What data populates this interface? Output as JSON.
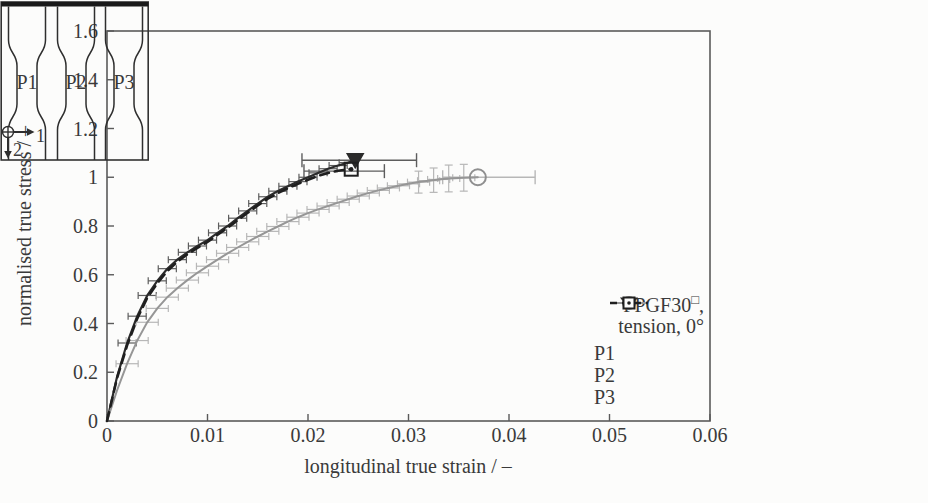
{
  "figure": {
    "background": "#fcfcfb",
    "axis_color": "#5a5a5a",
    "text_color": "#3a3a3a"
  },
  "chart_data": {
    "type": "line",
    "title": "",
    "xlabel": "longitudinal true strain / –",
    "ylabel": "normalised true stress / –",
    "xlim": [
      0,
      0.06
    ],
    "ylim": [
      0,
      1.6
    ],
    "grid": false,
    "legend_position": "inside-bottom-right",
    "x_ticks": {
      "values": [
        0,
        0.01,
        0.02,
        0.03,
        0.04,
        0.05,
        0.06
      ],
      "labels": [
        "0",
        "0.01",
        "0.02",
        "0.03",
        "0.04",
        "0.05",
        "0.06"
      ]
    },
    "y_ticks": {
      "values": [
        0,
        0.2,
        0.4,
        0.6,
        0.8,
        1.0,
        1.2,
        1.4,
        1.6
      ],
      "labels": [
        "0",
        "0.2",
        "0.4",
        "0.6",
        "0.8",
        "1",
        "1.2",
        "1.4",
        "1.6"
      ]
    },
    "series": [
      {
        "name": "P1",
        "color": "#2b2b2b",
        "line": "solid",
        "width": 2.2,
        "marker": "triangle-down",
        "marker_color": "#2b2b2b",
        "err_color": "#5d5d5d",
        "x_err": 0.0009,
        "end_bar": {
          "y": 1.07,
          "x0": 0.0194,
          "x1": 0.0308
        },
        "points": [
          [
            0,
            0
          ],
          [
            0.001,
            0.18
          ],
          [
            0.002,
            0.32
          ],
          [
            0.003,
            0.43
          ],
          [
            0.004,
            0.515
          ],
          [
            0.005,
            0.575
          ],
          [
            0.006,
            0.625
          ],
          [
            0.007,
            0.662
          ],
          [
            0.008,
            0.692
          ],
          [
            0.009,
            0.718
          ],
          [
            0.01,
            0.742
          ],
          [
            0.011,
            0.772
          ],
          [
            0.012,
            0.8
          ],
          [
            0.013,
            0.832
          ],
          [
            0.014,
            0.862
          ],
          [
            0.015,
            0.892
          ],
          [
            0.016,
            0.92
          ],
          [
            0.017,
            0.943
          ],
          [
            0.018,
            0.963
          ],
          [
            0.019,
            0.982
          ],
          [
            0.02,
            1.0
          ],
          [
            0.021,
            1.018
          ],
          [
            0.022,
            1.035
          ],
          [
            0.023,
            1.048
          ],
          [
            0.024,
            1.06
          ],
          [
            0.0247,
            1.07
          ]
        ]
      },
      {
        "name": "P2",
        "color": "#969696",
        "line": "solid",
        "width": 2,
        "marker": "circle",
        "marker_color": "#8f8f8f",
        "err_color": "#b7b7b7",
        "x_err": 0.0011,
        "end_bar": {
          "y": 1.0,
          "x0": 0.0334,
          "x1": 0.0426
        },
        "y_err": [
          {
            "x": 0.031,
            "y": 0.98,
            "h": 0.045
          },
          {
            "x": 0.0325,
            "y": 0.988,
            "h": 0.05
          },
          {
            "x": 0.034,
            "y": 0.995,
            "h": 0.055
          },
          {
            "x": 0.0355,
            "y": 0.998,
            "h": 0.055
          }
        ],
        "points": [
          [
            0,
            0
          ],
          [
            0.001,
            0.125
          ],
          [
            0.002,
            0.235
          ],
          [
            0.003,
            0.33
          ],
          [
            0.004,
            0.405
          ],
          [
            0.005,
            0.462
          ],
          [
            0.006,
            0.508
          ],
          [
            0.007,
            0.545
          ],
          [
            0.008,
            0.578
          ],
          [
            0.009,
            0.608
          ],
          [
            0.01,
            0.635
          ],
          [
            0.011,
            0.662
          ],
          [
            0.012,
            0.688
          ],
          [
            0.013,
            0.712
          ],
          [
            0.014,
            0.735
          ],
          [
            0.015,
            0.757
          ],
          [
            0.016,
            0.778
          ],
          [
            0.017,
            0.798
          ],
          [
            0.018,
            0.818
          ],
          [
            0.019,
            0.836
          ],
          [
            0.02,
            0.853
          ],
          [
            0.021,
            0.868
          ],
          [
            0.022,
            0.882
          ],
          [
            0.023,
            0.896
          ],
          [
            0.024,
            0.91
          ],
          [
            0.025,
            0.923
          ],
          [
            0.026,
            0.935
          ],
          [
            0.027,
            0.946
          ],
          [
            0.028,
            0.956
          ],
          [
            0.029,
            0.965
          ],
          [
            0.03,
            0.973
          ],
          [
            0.031,
            0.98
          ],
          [
            0.032,
            0.986
          ],
          [
            0.033,
            0.991
          ],
          [
            0.034,
            0.995
          ],
          [
            0.0355,
            0.998
          ],
          [
            0.0369,
            1.0
          ]
        ]
      },
      {
        "name": "P3",
        "color": "#1f1f1f",
        "line": "dashed",
        "width": 2.6,
        "marker": "square-dot",
        "marker_color": "#1f1f1f",
        "err_color": "#5d5d5d",
        "x_err": null,
        "end_bar": {
          "y": 1.025,
          "x0": 0.0196,
          "x1": 0.0276
        },
        "points": [
          [
            0,
            0
          ],
          [
            0.001,
            0.175
          ],
          [
            0.002,
            0.31
          ],
          [
            0.003,
            0.42
          ],
          [
            0.004,
            0.505
          ],
          [
            0.005,
            0.565
          ],
          [
            0.006,
            0.615
          ],
          [
            0.007,
            0.653
          ],
          [
            0.008,
            0.684
          ],
          [
            0.009,
            0.71
          ],
          [
            0.01,
            0.735
          ],
          [
            0.011,
            0.764
          ],
          [
            0.012,
            0.792
          ],
          [
            0.013,
            0.824
          ],
          [
            0.014,
            0.854
          ],
          [
            0.015,
            0.884
          ],
          [
            0.016,
            0.912
          ],
          [
            0.017,
            0.935
          ],
          [
            0.018,
            0.955
          ],
          [
            0.019,
            0.973
          ],
          [
            0.02,
            0.99
          ],
          [
            0.021,
            1.006
          ],
          [
            0.022,
            1.018
          ],
          [
            0.023,
            1.027
          ],
          [
            0.0243,
            1.033
          ]
        ]
      }
    ]
  },
  "legend": {
    "material": "PPGF30",
    "material_sup": "□",
    "material_suffix": ",",
    "condition": "tension, 0°",
    "entries": [
      "P1",
      "P2",
      "P3"
    ]
  },
  "inset": {
    "labels": [
      "P1",
      "P2",
      "P3"
    ],
    "axis1": "1",
    "axis2": "2"
  }
}
